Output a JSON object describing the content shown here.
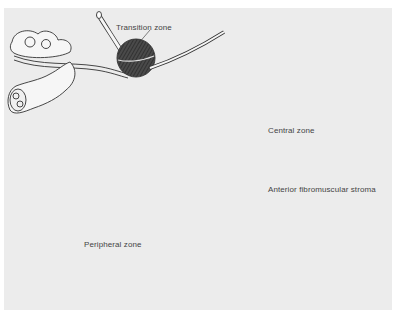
{
  "figure": {
    "panels": [
      {
        "id": "panel-1",
        "label": "Transition zone"
      },
      {
        "id": "panel-2",
        "label": "Central zone"
      },
      {
        "id": "panel-3",
        "label": "Peripheral zone"
      },
      {
        "id": "panel-4",
        "label": "Anterior fibromuscular stroma"
      }
    ]
  },
  "colors": {
    "background": "#ececec",
    "line": "#333333",
    "dark_fill": "#2a2a2a",
    "mid_fill": "#7a7a7a",
    "light_fill": "#f4f4f4"
  }
}
